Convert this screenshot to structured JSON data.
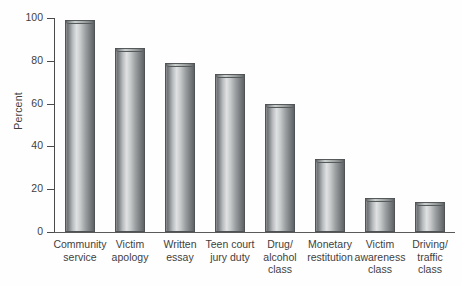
{
  "chart_data": {
    "type": "bar",
    "title": "",
    "xlabel": "",
    "ylabel": "Percent",
    "ylim": [
      0,
      100
    ],
    "yticks": [
      0,
      20,
      40,
      60,
      80,
      100
    ],
    "grid": false,
    "legend": false,
    "categories": [
      "Community service",
      "Victim apology",
      "Written essay",
      "Teen court jury duty",
      "Drug/ alcohol class",
      "Monetary restitution",
      "Victim awareness class",
      "Driving/ traffic class"
    ],
    "values": [
      99,
      86,
      79,
      74,
      60,
      34,
      16,
      14
    ]
  },
  "axis": {
    "y_title": "Percent",
    "y_tick_labels": [
      "100",
      "80",
      "60",
      "40",
      "20",
      "0"
    ]
  },
  "bars": [
    {
      "value": 99,
      "label_lines": [
        "Community",
        "service"
      ]
    },
    {
      "value": 86,
      "label_lines": [
        "Victim",
        "apology"
      ]
    },
    {
      "value": 79,
      "label_lines": [
        "Written",
        "essay"
      ]
    },
    {
      "value": 74,
      "label_lines": [
        "Teen court",
        "jury duty"
      ]
    },
    {
      "value": 60,
      "label_lines": [
        "Drug/",
        "alcohol",
        "class"
      ]
    },
    {
      "value": 34,
      "label_lines": [
        "Monetary",
        "restitution"
      ]
    },
    {
      "value": 16,
      "label_lines": [
        "Victim",
        "awareness",
        "class"
      ]
    },
    {
      "value": 14,
      "label_lines": [
        "Driving/",
        "traffic",
        "class"
      ]
    }
  ],
  "colors": {
    "axis": "#4a4a4a",
    "text": "#3f3f3f",
    "bar_light": "#dfe1e2",
    "bar_dark": "#5f6366",
    "background": "#ffffff"
  }
}
